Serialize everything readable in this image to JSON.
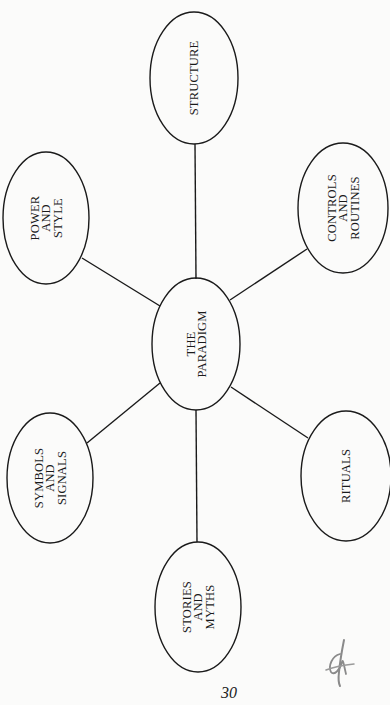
{
  "diagram": {
    "center": {
      "id": "paradigm",
      "lines": [
        "THE",
        "PARADIGM"
      ],
      "cx": 196,
      "cy": 344,
      "rx": 44,
      "ry": 66
    },
    "nodes": [
      {
        "id": "structure",
        "lines": [
          "STRUCTURE"
        ],
        "cx": 194,
        "cy": 78,
        "rx": 44,
        "ry": 66
      },
      {
        "id": "power-and-style",
        "lines": [
          "POWER",
          "AND",
          "STYLE"
        ],
        "cx": 46,
        "cy": 218,
        "rx": 43,
        "ry": 66
      },
      {
        "id": "controls-and-routines",
        "lines": [
          "CONTROLS",
          "AND",
          "ROUTINES"
        ],
        "cx": 343,
        "cy": 208,
        "rx": 45,
        "ry": 65
      },
      {
        "id": "symbols-and-signals",
        "lines": [
          "SYMBOLS",
          "AND",
          "SIGNALS"
        ],
        "cx": 50,
        "cy": 478,
        "rx": 43,
        "ry": 65
      },
      {
        "id": "rituals",
        "lines": [
          "RITUALS"
        ],
        "cx": 346,
        "cy": 476,
        "rx": 45,
        "ry": 65
      },
      {
        "id": "stories-and-myths",
        "lines": [
          "STORIES",
          "AND",
          "MYTHS"
        ],
        "cx": 198,
        "cy": 607,
        "rx": 43,
        "ry": 65
      }
    ],
    "edges": [
      {
        "from": "paradigm",
        "to": "structure",
        "x1": 196,
        "y1": 279,
        "x2": 195,
        "y2": 144
      },
      {
        "from": "paradigm",
        "to": "power-and-style",
        "x1": 160,
        "y1": 306,
        "x2": 82,
        "y2": 258
      },
      {
        "from": "paradigm",
        "to": "controls-and-routines",
        "x1": 230,
        "y1": 300,
        "x2": 307,
        "y2": 249
      },
      {
        "from": "paradigm",
        "to": "symbols-and-signals",
        "x1": 160,
        "y1": 383,
        "x2": 87,
        "y2": 443
      },
      {
        "from": "paradigm",
        "to": "rituals",
        "x1": 231,
        "y1": 387,
        "x2": 308,
        "y2": 438
      },
      {
        "from": "paradigm",
        "to": "stories-and-myths",
        "x1": 196,
        "y1": 410,
        "x2": 197,
        "y2": 542
      }
    ],
    "text_orientation": "rotated -90deg (reads bottom to top)",
    "stroke_color": "#1a1a1a",
    "background_color": "#fbfbfa"
  },
  "footer": {
    "page_number": "30",
    "handwritten_mark_color": "#8a8a8a"
  }
}
